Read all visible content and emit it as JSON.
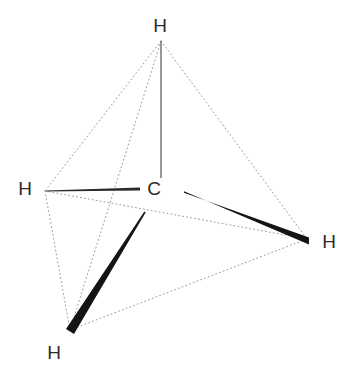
{
  "diagram": {
    "molecule": "CH4",
    "background_color": "#ffffff",
    "label_color": "#2b2b2b",
    "dotted_edge_color": "#9a9a9a",
    "plain_bond_color": "#6b6b6b",
    "wedge_bond_color": "#1a1a1a",
    "atoms": [
      {
        "id": "c-center",
        "element": "C",
        "label": "C",
        "x": 154,
        "y": 188,
        "role": "central-carbon"
      },
      {
        "id": "h-top",
        "element": "H",
        "label": "H",
        "x": 160,
        "y": 25,
        "role": "hydrogen-top"
      },
      {
        "id": "h-left",
        "element": "H",
        "label": "H",
        "x": 25,
        "y": 188,
        "role": "hydrogen-left"
      },
      {
        "id": "h-right",
        "element": "H",
        "label": "H",
        "x": 329,
        "y": 241,
        "role": "hydrogen-right"
      },
      {
        "id": "h-bottom",
        "element": "H",
        "label": "H",
        "x": 54,
        "y": 352,
        "role": "hydrogen-bottom-left"
      }
    ],
    "vertices": {
      "apex": {
        "x": 161,
        "y": 41
      },
      "left": {
        "x": 45,
        "y": 191
      },
      "right": {
        "x": 307,
        "y": 239
      },
      "bottom": {
        "x": 70,
        "y": 330
      },
      "carbon_hub": {
        "x": 166,
        "y": 190
      }
    },
    "bonds": [
      {
        "id": "bond-c-h-top",
        "type": "plain",
        "from": "c-center",
        "to": "h-top",
        "x1": 161,
        "y1": 41,
        "x2": 161,
        "y2": 178,
        "width": 1.4
      },
      {
        "id": "bond-c-h-left",
        "type": "reverse-taper",
        "from": "c-center",
        "to": "h-left",
        "x1": 140,
        "y1": 189,
        "x2": 46,
        "y2": 191,
        "width_start": 3.0,
        "width_end": 0.8
      },
      {
        "id": "bond-c-h-right",
        "type": "wedge",
        "from": "c-center",
        "to": "h-right",
        "x1": 184,
        "y1": 192,
        "x2": 308,
        "y2": 241,
        "width_start": 1.6,
        "width_end": 7.5
      },
      {
        "id": "bond-c-h-bottom",
        "type": "wedge",
        "from": "c-center",
        "to": "h-bottom",
        "x1": 145,
        "y1": 212,
        "x2": 70,
        "y2": 331,
        "width_start": 1.2,
        "width_end": 8.0
      }
    ],
    "tetrahedron_edges": [
      {
        "id": "edge-apex-left",
        "x1": 161,
        "y1": 41,
        "x2": 45,
        "y2": 191
      },
      {
        "id": "edge-apex-right",
        "x1": 161,
        "y1": 41,
        "x2": 307,
        "y2": 239
      },
      {
        "id": "edge-apex-bottom",
        "x1": 161,
        "y1": 41,
        "x2": 70,
        "y2": 330
      },
      {
        "id": "edge-left-right",
        "x1": 45,
        "y1": 191,
        "x2": 307,
        "y2": 239
      },
      {
        "id": "edge-left-bottom",
        "x1": 45,
        "y1": 191,
        "x2": 70,
        "y2": 330
      },
      {
        "id": "edge-bottom-right",
        "x1": 70,
        "y1": 330,
        "x2": 307,
        "y2": 239
      }
    ],
    "dash_pattern": "1 3",
    "dash_width": 1
  }
}
